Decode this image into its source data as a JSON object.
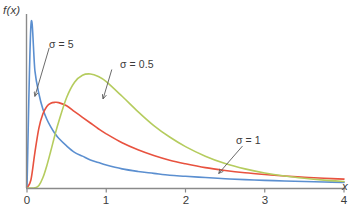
{
  "figure": {
    "background": "#ffffff",
    "axis_color": "#8a8a8a",
    "text_color": "#3b3b3b"
  },
  "axes": {
    "y_label": "f(x)",
    "x_label": "x",
    "x_ticks": [
      "0",
      "1",
      "2",
      "3",
      "4"
    ]
  },
  "annotations": {
    "sigma5": "σ = 5",
    "sigma05": "σ = 0.5",
    "sigma1": "σ = 1"
  },
  "chart_data": {
    "type": "line",
    "title": "",
    "xlabel": "x",
    "ylabel": "f(x)",
    "xlim": [
      0,
      4
    ],
    "ylim": [
      0,
      1.35
    ],
    "grid": false,
    "legend": "inline-annotations",
    "x": [
      0.0,
      0.05,
      0.1,
      0.15,
      0.2,
      0.25,
      0.3,
      0.35,
      0.4,
      0.5,
      0.6,
      0.7,
      0.8,
      0.9,
      1.0,
      1.2,
      1.4,
      1.6,
      1.8,
      2.0,
      2.25,
      2.5,
      2.75,
      3.0,
      3.25,
      3.5,
      3.75,
      4.0
    ],
    "series": [
      {
        "name": "σ = 5",
        "color": "#5b8fd0",
        "label_position": {
          "x": 0.28,
          "y": 1.1
        },
        "arrow_tip": {
          "x": 0.1,
          "y": 0.72
        },
        "values": [
          0.0,
          1.28,
          0.92,
          0.74,
          0.62,
          0.54,
          0.48,
          0.43,
          0.39,
          0.33,
          0.28,
          0.25,
          0.22,
          0.2,
          0.18,
          0.15,
          0.13,
          0.115,
          0.1,
          0.092,
          0.082,
          0.073,
          0.066,
          0.06,
          0.055,
          0.051,
          0.047,
          0.044
        ]
      },
      {
        "name": "σ = 1",
        "color": "#e8523f",
        "label_position": {
          "x": 2.72,
          "y": 0.33
        },
        "arrow_tip": {
          "x": 2.42,
          "y": 0.115
        },
        "values": [
          0.0,
          0.065,
          0.28,
          0.47,
          0.58,
          0.64,
          0.665,
          0.672,
          0.67,
          0.645,
          0.6,
          0.555,
          0.51,
          0.465,
          0.425,
          0.355,
          0.3,
          0.255,
          0.218,
          0.19,
          0.16,
          0.138,
          0.12,
          0.106,
          0.094,
          0.084,
          0.076,
          0.07
        ]
      },
      {
        "name": "σ = 0.5",
        "color": "#b5cc5e",
        "label_position": {
          "x": 1.07,
          "y": 0.93
        },
        "arrow_tip": {
          "x": 0.96,
          "y": 0.7
        },
        "values": [
          0.0,
          0.0,
          0.0015,
          0.02,
          0.08,
          0.175,
          0.29,
          0.41,
          0.52,
          0.71,
          0.83,
          0.885,
          0.895,
          0.875,
          0.835,
          0.72,
          0.6,
          0.49,
          0.4,
          0.325,
          0.25,
          0.192,
          0.15,
          0.118,
          0.094,
          0.076,
          0.062,
          0.051
        ]
      }
    ]
  }
}
